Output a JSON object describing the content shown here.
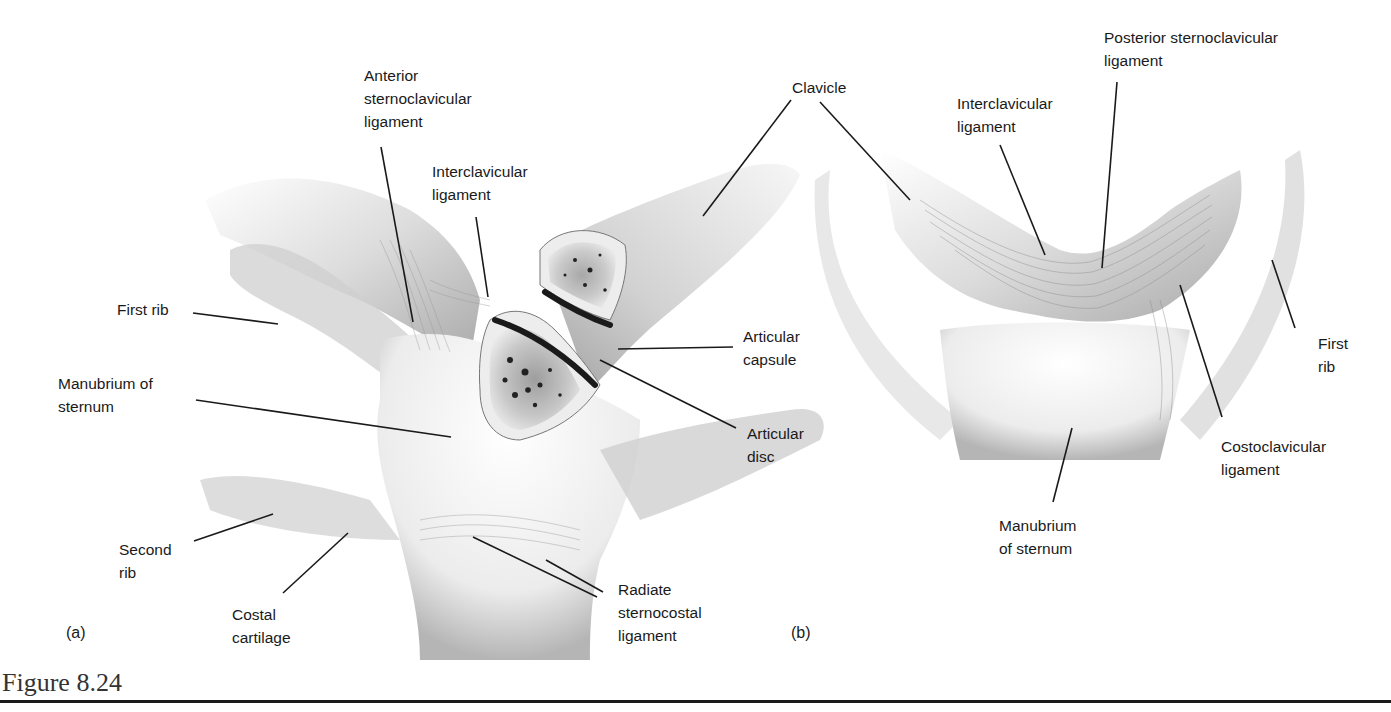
{
  "figure": {
    "caption": "Figure 8.24",
    "panels": [
      {
        "letter": "(a)",
        "labels": {
          "anterior_sternoclavicular_ligament": "Anterior\nsternoclavicular\nligament",
          "interclavicular_ligament": "Interclavicular\nligament",
          "clavicle": "Clavicle",
          "first_rib": "First rib",
          "articular_capsule": "Articular\ncapsule",
          "manubrium_of_sternum": "Manubrium of\nsternum",
          "articular_disc": "Articular\ndisc",
          "second_rib": "Second\nrib",
          "costal_cartilage": "Costal\ncartilage",
          "radiate_sternocostal_ligament": "Radiate\nsternocostal\nligament"
        }
      },
      {
        "letter": "(b)",
        "labels": {
          "posterior_sternoclavicular_ligament": "Posterior sternoclavicular\nligament",
          "interclavicular_ligament": "Interclavicular\nligament",
          "first_rib": "First\nrib",
          "costoclavicular_ligament": "Costoclavicular\nligament",
          "manubrium_of_sternum": "Manubrium\nof sternum"
        }
      }
    ]
  },
  "colors": {
    "ink": "#1a1a1a",
    "shade_dark": "#6e6e6e",
    "shade_mid": "#a8a8a8",
    "shade_light": "#d9d9d9",
    "background": "#ffffff"
  }
}
